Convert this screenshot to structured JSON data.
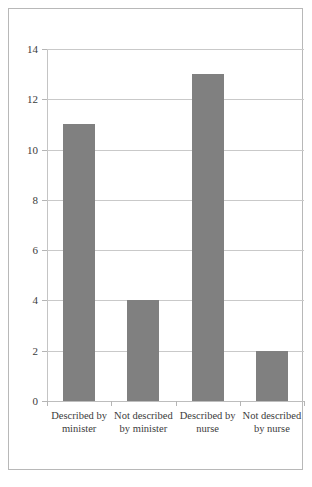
{
  "chart_data": {
    "type": "bar",
    "title": "",
    "subtitle": "",
    "xlabel": "",
    "ylabel": "",
    "categories": [
      "Described by minister",
      "Not described by minister",
      "Described by nurse",
      "Not described by nurse"
    ],
    "values": [
      11,
      4,
      13,
      2
    ],
    "ylim": [
      0,
      14
    ],
    "ytick_values": [
      14,
      12,
      10,
      8,
      6,
      4,
      2,
      0
    ],
    "ytick_labels": [
      "14",
      "12",
      "10",
      "8",
      "6",
      "4",
      "2",
      "0"
    ],
    "grid": true,
    "grid_axis": "y",
    "legend": false,
    "legend_position": "none",
    "bar_color": "#808080",
    "gridline_color": "#c9c9c9",
    "axis_color": "#b5b5b5",
    "background_color": "#ffffff",
    "border_color": "#b8b8b8",
    "text_color": "#3b3b3b"
  }
}
